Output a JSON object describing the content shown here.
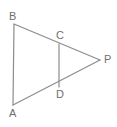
{
  "figure": {
    "kind": "geometry-diagram",
    "background_color": "#ffffff",
    "stroke_color": "#8c8c8c",
    "label_color": "#6f6f6f",
    "stroke_width": 1.2,
    "canvas": {
      "width": 117,
      "height": 127
    },
    "points": [
      {
        "id": "B",
        "label": "B",
        "x": 14,
        "y": 24,
        "label_x": 9,
        "label_y": 11
      },
      {
        "id": "A",
        "label": "A",
        "x": 13,
        "y": 105,
        "label_x": 9,
        "label_y": 108
      },
      {
        "id": "C",
        "label": "C",
        "x": 59,
        "y": 44,
        "label_x": 56,
        "label_y": 30
      },
      {
        "id": "D",
        "label": "D",
        "x": 59,
        "y": 87,
        "label_x": 56,
        "label_y": 89
      },
      {
        "id": "P",
        "label": "P",
        "x": 100,
        "y": 60,
        "label_x": 104,
        "label_y": 54
      }
    ],
    "segments": [
      {
        "id": "AB",
        "from": "B",
        "to": "A",
        "name": "segment-ab"
      },
      {
        "id": "BP",
        "from": "B",
        "to": "P",
        "name": "segment-bp"
      },
      {
        "id": "AP",
        "from": "A",
        "to": "P",
        "name": "segment-ap"
      },
      {
        "id": "CD",
        "from": "C",
        "to": "D",
        "name": "segment-cd"
      }
    ]
  }
}
